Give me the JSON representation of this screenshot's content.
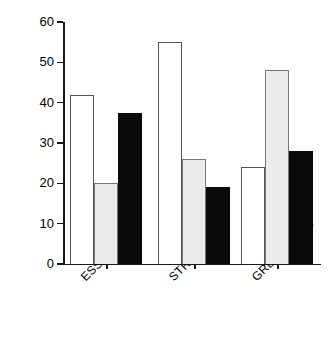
{
  "chart_data": {
    "type": "bar",
    "title": "",
    "xlabel": "",
    "ylabel": "FREQUENCY (%)",
    "categories": [
      "ESSEX",
      "STRATFORD",
      "GREY-BRUCE"
    ],
    "series": [
      {
        "name": "series-1-open",
        "color": "#ffffff",
        "values": [
          42,
          55,
          24
        ]
      },
      {
        "name": "series-2-gray",
        "color": "#ebebeb",
        "values": [
          20,
          26,
          48
        ]
      },
      {
        "name": "series-3-black",
        "color": "#0a0a0a",
        "values": [
          37.5,
          19,
          28
        ]
      }
    ],
    "ylim": [
      0,
      60
    ],
    "yticks": [
      0,
      10,
      20,
      30,
      40,
      50,
      60
    ],
    "ytick_labels": [
      "0",
      "10",
      "20",
      "30",
      "40",
      "50",
      "60"
    ],
    "grid": false,
    "legend": "none",
    "category_label_rotation": -45
  }
}
